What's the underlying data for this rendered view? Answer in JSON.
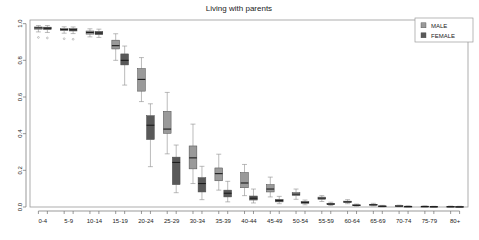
{
  "chart_data": {
    "type": "box",
    "title": "Living with parents",
    "xlabel": "",
    "ylabel": "",
    "ylim": [
      0.0,
      1.02
    ],
    "grid": false,
    "legend_position": "top-right",
    "ytick_labels": [
      "1.0",
      "0.8",
      "0.6",
      "0.4",
      "0.2",
      "0.0"
    ],
    "ytick_values": [
      1.0,
      0.8,
      0.6,
      0.4,
      0.2,
      0.0
    ],
    "categories": [
      "0-4",
      "5-9",
      "10-14",
      "15-19",
      "20-24",
      "25-29",
      "30-34",
      "35-39",
      "40-44",
      "45-49",
      "50-54",
      "55-59",
      "60-64",
      "65-69",
      "70-74",
      "75-79",
      "80+"
    ],
    "legend": [
      {
        "label": "MALE",
        "color": "#9a9a9a"
      },
      {
        "label": "FEMALE",
        "color": "#595959"
      }
    ],
    "series": [
      {
        "name": "MALE",
        "color": "#9a9a9a",
        "boxes": [
          {
            "category": "0-4",
            "whisker_low": 0.955,
            "q1": 0.97,
            "median": 0.977,
            "q3": 0.982,
            "whisker_high": 0.99,
            "outliers": [
              0.925
            ]
          },
          {
            "category": "5-9",
            "whisker_low": 0.948,
            "q1": 0.962,
            "median": 0.968,
            "q3": 0.974,
            "whisker_high": 0.983,
            "outliers": [
              0.918
            ]
          },
          {
            "category": "10-14",
            "whisker_low": 0.928,
            "q1": 0.943,
            "median": 0.952,
            "q3": 0.96,
            "whisker_high": 0.972,
            "outliers": []
          },
          {
            "category": "15-19",
            "whisker_low": 0.8,
            "q1": 0.862,
            "median": 0.88,
            "q3": 0.91,
            "whisker_high": 0.945,
            "outliers": []
          },
          {
            "category": "20-24",
            "whisker_low": 0.575,
            "q1": 0.632,
            "median": 0.696,
            "q3": 0.755,
            "whisker_high": 0.815,
            "outliers": []
          },
          {
            "category": "25-29",
            "whisker_low": 0.29,
            "q1": 0.402,
            "median": 0.425,
            "q3": 0.522,
            "whisker_high": 0.625,
            "outliers": []
          },
          {
            "category": "30-34",
            "whisker_low": 0.128,
            "q1": 0.208,
            "median": 0.268,
            "q3": 0.333,
            "whisker_high": 0.452,
            "outliers": []
          },
          {
            "category": "35-39",
            "whisker_low": 0.092,
            "q1": 0.143,
            "median": 0.182,
            "q3": 0.213,
            "whisker_high": 0.288,
            "outliers": []
          },
          {
            "category": "40-44",
            "whisker_low": 0.062,
            "q1": 0.105,
            "median": 0.131,
            "q3": 0.188,
            "whisker_high": 0.232,
            "outliers": []
          },
          {
            "category": "45-49",
            "whisker_low": 0.055,
            "q1": 0.082,
            "median": 0.098,
            "q3": 0.122,
            "whisker_high": 0.163,
            "outliers": []
          },
          {
            "category": "50-54",
            "whisker_low": 0.042,
            "q1": 0.062,
            "median": 0.07,
            "q3": 0.079,
            "whisker_high": 0.098,
            "outliers": []
          },
          {
            "category": "55-59",
            "whisker_low": 0.03,
            "q1": 0.042,
            "median": 0.048,
            "q3": 0.054,
            "whisker_high": 0.062,
            "outliers": []
          },
          {
            "category": "60-64",
            "whisker_low": 0.018,
            "q1": 0.024,
            "median": 0.028,
            "q3": 0.032,
            "whisker_high": 0.04,
            "outliers": []
          },
          {
            "category": "65-69",
            "whisker_low": 0.006,
            "q1": 0.01,
            "median": 0.012,
            "q3": 0.015,
            "whisker_high": 0.02,
            "outliers": []
          },
          {
            "category": "70-74",
            "whisker_low": 0.002,
            "q1": 0.004,
            "median": 0.005,
            "q3": 0.007,
            "whisker_high": 0.01,
            "outliers": []
          },
          {
            "category": "75-79",
            "whisker_low": 0.001,
            "q1": 0.002,
            "median": 0.003,
            "q3": 0.004,
            "whisker_high": 0.006,
            "outliers": []
          },
          {
            "category": "80+",
            "whisker_low": 0.0,
            "q1": 0.001,
            "median": 0.002,
            "q3": 0.003,
            "whisker_high": 0.005,
            "outliers": []
          }
        ]
      },
      {
        "name": "FEMALE",
        "color": "#595959",
        "boxes": [
          {
            "category": "0-4",
            "whisker_low": 0.952,
            "q1": 0.968,
            "median": 0.975,
            "q3": 0.981,
            "whisker_high": 0.99,
            "outliers": [
              0.922
            ]
          },
          {
            "category": "5-9",
            "whisker_low": 0.946,
            "q1": 0.96,
            "median": 0.967,
            "q3": 0.973,
            "whisker_high": 0.982,
            "outliers": [
              0.915
            ]
          },
          {
            "category": "10-14",
            "whisker_low": 0.925,
            "q1": 0.94,
            "median": 0.949,
            "q3": 0.958,
            "whisker_high": 0.97,
            "outliers": []
          },
          {
            "category": "15-19",
            "whisker_low": 0.665,
            "q1": 0.775,
            "median": 0.8,
            "q3": 0.835,
            "whisker_high": 0.878,
            "outliers": []
          },
          {
            "category": "20-24",
            "whisker_low": 0.22,
            "q1": 0.368,
            "median": 0.446,
            "q3": 0.498,
            "whisker_high": 0.563,
            "outliers": []
          },
          {
            "category": "25-29",
            "whisker_low": 0.078,
            "q1": 0.122,
            "median": 0.243,
            "q3": 0.272,
            "whisker_high": 0.338,
            "outliers": []
          },
          {
            "category": "30-34",
            "whisker_low": 0.04,
            "q1": 0.082,
            "median": 0.128,
            "q3": 0.16,
            "whisker_high": 0.222,
            "outliers": []
          },
          {
            "category": "35-39",
            "whisker_low": 0.028,
            "q1": 0.055,
            "median": 0.075,
            "q3": 0.092,
            "whisker_high": 0.14,
            "outliers": []
          },
          {
            "category": "40-44",
            "whisker_low": 0.022,
            "q1": 0.038,
            "median": 0.048,
            "q3": 0.06,
            "whisker_high": 0.098,
            "outliers": []
          },
          {
            "category": "45-49",
            "whisker_low": 0.018,
            "q1": 0.028,
            "median": 0.035,
            "q3": 0.042,
            "whisker_high": 0.058,
            "outliers": []
          },
          {
            "category": "50-54",
            "whisker_low": 0.012,
            "q1": 0.02,
            "median": 0.025,
            "q3": 0.03,
            "whisker_high": 0.038,
            "outliers": []
          },
          {
            "category": "55-59",
            "whisker_low": 0.008,
            "q1": 0.013,
            "median": 0.016,
            "q3": 0.02,
            "whisker_high": 0.026,
            "outliers": []
          },
          {
            "category": "60-64",
            "whisker_low": 0.004,
            "q1": 0.007,
            "median": 0.009,
            "q3": 0.012,
            "whisker_high": 0.016,
            "outliers": []
          },
          {
            "category": "65-69",
            "whisker_low": 0.001,
            "q1": 0.003,
            "median": 0.004,
            "q3": 0.006,
            "whisker_high": 0.009,
            "outliers": []
          },
          {
            "category": "70-74",
            "whisker_low": 0.0,
            "q1": 0.002,
            "median": 0.003,
            "q3": 0.004,
            "whisker_high": 0.006,
            "outliers": []
          },
          {
            "category": "75-79",
            "whisker_low": 0.0,
            "q1": 0.001,
            "median": 0.002,
            "q3": 0.003,
            "whisker_high": 0.004,
            "outliers": []
          },
          {
            "category": "80+",
            "whisker_low": 0.0,
            "q1": 0.001,
            "median": 0.001,
            "q3": 0.002,
            "whisker_high": 0.004,
            "outliers": []
          }
        ]
      }
    ]
  },
  "layout": {
    "plot_left": 30,
    "plot_right": 468,
    "plot_top": 20,
    "plot_bottom": 207,
    "title_x": 239,
    "title_y": 11,
    "legend_x": 415,
    "legend_y": 18,
    "legend_w": 58,
    "legend_h": 24
  }
}
